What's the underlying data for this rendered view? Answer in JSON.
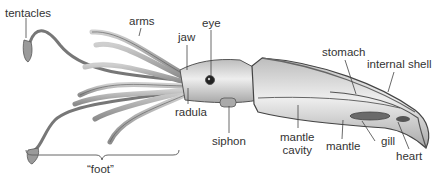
{
  "diagram": {
    "labels": {
      "tentacles": "tentacles",
      "arms": "arms",
      "jaw": "jaw",
      "eye": "eye",
      "radula": "radula",
      "siphon": "siphon",
      "stomach": "stomach",
      "internal_shell": "internal shell",
      "mantle_cavity_line1": "mantle",
      "mantle_cavity_line2": "cavity",
      "mantle": "mantle",
      "gill": "gill",
      "heart": "heart",
      "foot": "“foot”"
    },
    "colors": {
      "body": "#d8d8d8",
      "outline": "#555555",
      "leader": "#444444",
      "text": "#333333"
    }
  }
}
